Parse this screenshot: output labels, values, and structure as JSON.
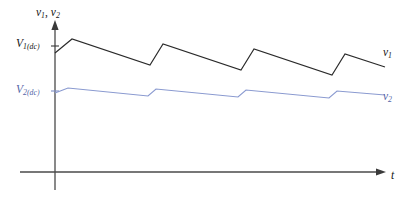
{
  "figure": {
    "background": "#ffffff",
    "axis_color": "#4a4a4a",
    "v1_color": "#2b2b2b",
    "v2_color": "#8a9ad0",
    "v2_label_color": "#5566a8"
  },
  "labels": {
    "y_axis_quantity_v": "v",
    "y_axis_quantity_sub1": "1",
    "y_axis_quantity_comma": ", ",
    "y_axis_quantity_sub2": "2",
    "v1_dc_main": "V",
    "v1_dc_sub": "1(dc)",
    "v2_dc_main": "V",
    "v2_dc_sub": "2(dc)",
    "v1_curve_main": "v",
    "v1_curve_sub": "1",
    "v2_curve_main": "v",
    "v2_curve_sub": "2",
    "x_axis_time": "t"
  },
  "chart_data": {
    "type": "line",
    "title": "",
    "xlabel": "t",
    "ylabel": "v1, v2",
    "grid": false,
    "legend": "inline-right",
    "axes": {
      "origin_px": [
        55,
        172
      ],
      "y_axis_top_px": 22,
      "y_axis_bottom_px": 190,
      "x_axis_right_px": 385,
      "x_tick_labels": [],
      "y_tick_labels": [
        "V1(dc)",
        "V2(dc)"
      ],
      "y_tick_values_px": [
        46,
        91
      ]
    },
    "series": [
      {
        "name": "v1",
        "label": "v1",
        "color": "#2b2b2b",
        "description": "Sawtooth ripple voltage on first capacitor: rapid rise then slow exponential-like decay, about 3.5 cycles shown, mean level V1(dc), large ripple amplitude.",
        "dc_level_px": 46,
        "ripple_peak_px": 39,
        "ripple_valley_px": 65,
        "cycles": 3.5,
        "points_px": [
          [
            55,
            53
          ],
          [
            72,
            39
          ],
          [
            150,
            65
          ],
          [
            163,
            44
          ],
          [
            241,
            70
          ],
          [
            254,
            49
          ],
          [
            332,
            75
          ],
          [
            345,
            54
          ],
          [
            385,
            67
          ]
        ]
      },
      {
        "name": "v2",
        "label": "v2",
        "color": "#8a9ad0",
        "description": "Ripple voltage on second capacitor: same period but much smaller ripple amplitude, riding at lower dc level V2(dc), slight downward droop overall.",
        "dc_level_px": 91,
        "ripple_peak_px": 88,
        "ripple_valley_px": 96,
        "cycles": 3.5,
        "points_px": [
          [
            55,
            93
          ],
          [
            68,
            88
          ],
          [
            148,
            96
          ],
          [
            156,
            89
          ],
          [
            238,
            97
          ],
          [
            246,
            90
          ],
          [
            329,
            98
          ],
          [
            337,
            91
          ],
          [
            385,
            95
          ]
        ]
      }
    ]
  }
}
